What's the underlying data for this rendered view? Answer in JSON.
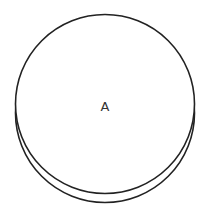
{
  "diagram": {
    "type": "venn-like-stacked-circles",
    "stroke_color": "#222222",
    "fill_color": "#ffffff",
    "circles": [
      {
        "id": "back",
        "cx": 105,
        "cy": 113,
        "r": 90
      },
      {
        "id": "front",
        "cx": 105,
        "cy": 104,
        "r": 90,
        "label": "A"
      }
    ],
    "label": "A"
  }
}
